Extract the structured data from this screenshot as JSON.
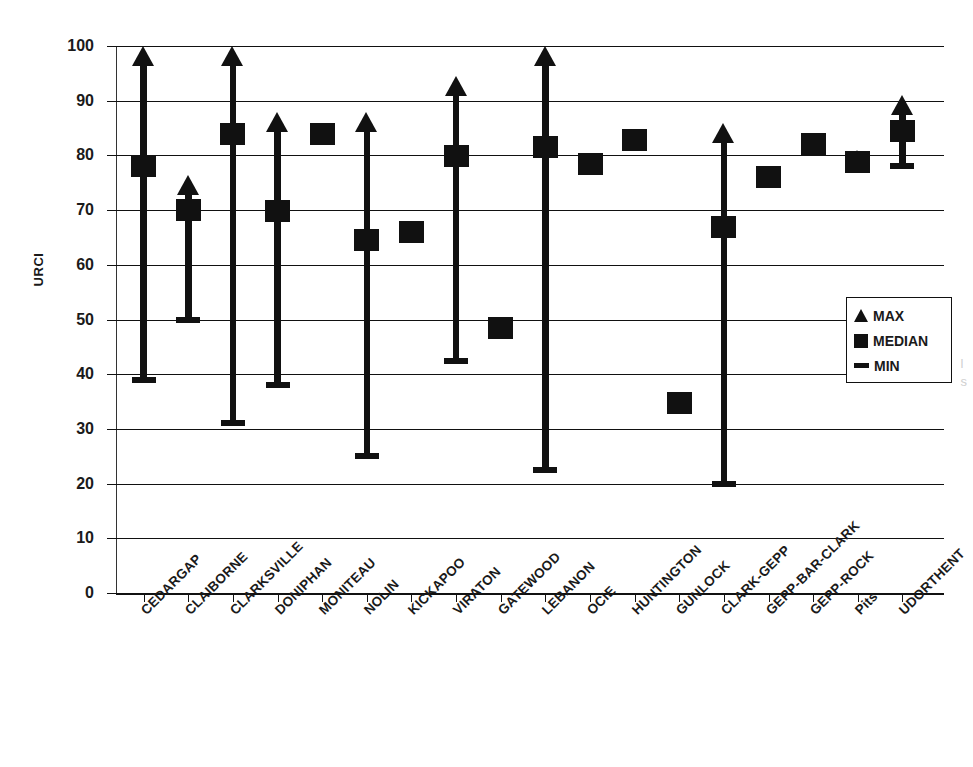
{
  "chart_data": {
    "type": "bar",
    "title": "",
    "subtitle": "",
    "xlabel": "",
    "ylabel": "URCI",
    "ylim": [
      0,
      100
    ],
    "ytick_step": 10,
    "ytick_labels": [
      "100",
      "90",
      "80",
      "70",
      "60",
      "50",
      "40",
      "30",
      "20",
      "10",
      "0"
    ],
    "grid": true,
    "legend_position": "right-middle",
    "legend": [
      {
        "marker": "triangle-up",
        "label": "MAX"
      },
      {
        "marker": "square",
        "label": "MEDIAN"
      },
      {
        "marker": "dash",
        "label": "MIN"
      }
    ],
    "categories": [
      "CEDARGAP",
      "CLAIBORNE",
      "CLARKSVILLE",
      "DONIPHAN",
      "MONITEAU",
      "NOLIN",
      "KICKAPOO",
      "VIRATON",
      "GATEWOOD",
      "LEBANON",
      "OCIE",
      "HUNTINGTON",
      "GUNLOCK",
      "CLARK-GEPP",
      "GEPP-BAR-CLARK",
      "GEPP-ROCK",
      "Pits",
      "UDORTHENT"
    ],
    "series": [
      {
        "name": "MIN",
        "values": [
          39,
          50,
          31,
          38,
          null,
          25,
          null,
          42.5,
          null,
          22.5,
          null,
          null,
          null,
          20,
          null,
          null,
          78.8,
          78
        ]
      },
      {
        "name": "MEDIAN",
        "values": [
          78,
          70,
          84,
          69.8,
          84,
          64.5,
          66,
          79.8,
          48.5,
          81.5,
          78.5,
          82.8,
          34.7,
          67,
          76,
          82,
          78.8,
          84.5
        ]
      },
      {
        "name": "MAX",
        "values": [
          100,
          76.5,
          100,
          88,
          null,
          88,
          null,
          94.5,
          null,
          100,
          null,
          null,
          null,
          86,
          null,
          null,
          81,
          91
        ]
      }
    ],
    "points": [
      {
        "category": "CEDARGAP",
        "min": 39,
        "median": 78,
        "max": 100
      },
      {
        "category": "CLAIBORNE",
        "min": 50,
        "median": 70,
        "max": 76.5
      },
      {
        "category": "CLARKSVILLE",
        "min": 31,
        "median": 84,
        "max": 100
      },
      {
        "category": "DONIPHAN",
        "min": 38,
        "median": 69.8,
        "max": 88
      },
      {
        "category": "MONITEAU",
        "min": null,
        "median": 84,
        "max": null
      },
      {
        "category": "NOLIN",
        "min": 25,
        "median": 64.5,
        "max": 88
      },
      {
        "category": "KICKAPOO",
        "min": null,
        "median": 66,
        "max": null
      },
      {
        "category": "VIRATON",
        "min": 42.5,
        "median": 79.8,
        "max": 94.5
      },
      {
        "category": "GATEWOOD",
        "min": null,
        "median": 48.5,
        "max": null
      },
      {
        "category": "LEBANON",
        "min": 22.5,
        "median": 81.5,
        "max": 100
      },
      {
        "category": "OCIE",
        "min": null,
        "median": 78.5,
        "max": null
      },
      {
        "category": "HUNTINGTON",
        "min": null,
        "median": 82.8,
        "max": null
      },
      {
        "category": "GUNLOCK",
        "min": null,
        "median": 34.7,
        "max": null
      },
      {
        "category": "CLARK-GEPP",
        "min": 20,
        "median": 67,
        "max": 86
      },
      {
        "category": "GEPP-BAR-CLARK",
        "min": null,
        "median": 76,
        "max": null
      },
      {
        "category": "GEPP-ROCK",
        "min": null,
        "median": 82,
        "max": null
      },
      {
        "category": "Pits",
        "min": 78.8,
        "median": 78.8,
        "max": 81
      },
      {
        "category": "UDORTHENT",
        "min": 78,
        "median": 84.5,
        "max": 91
      }
    ],
    "colors": {
      "marker": "#111111",
      "grid": "#111111",
      "background": "#ffffff"
    }
  },
  "edge_artifact": {
    "line1": "l",
    "line2": "s"
  }
}
